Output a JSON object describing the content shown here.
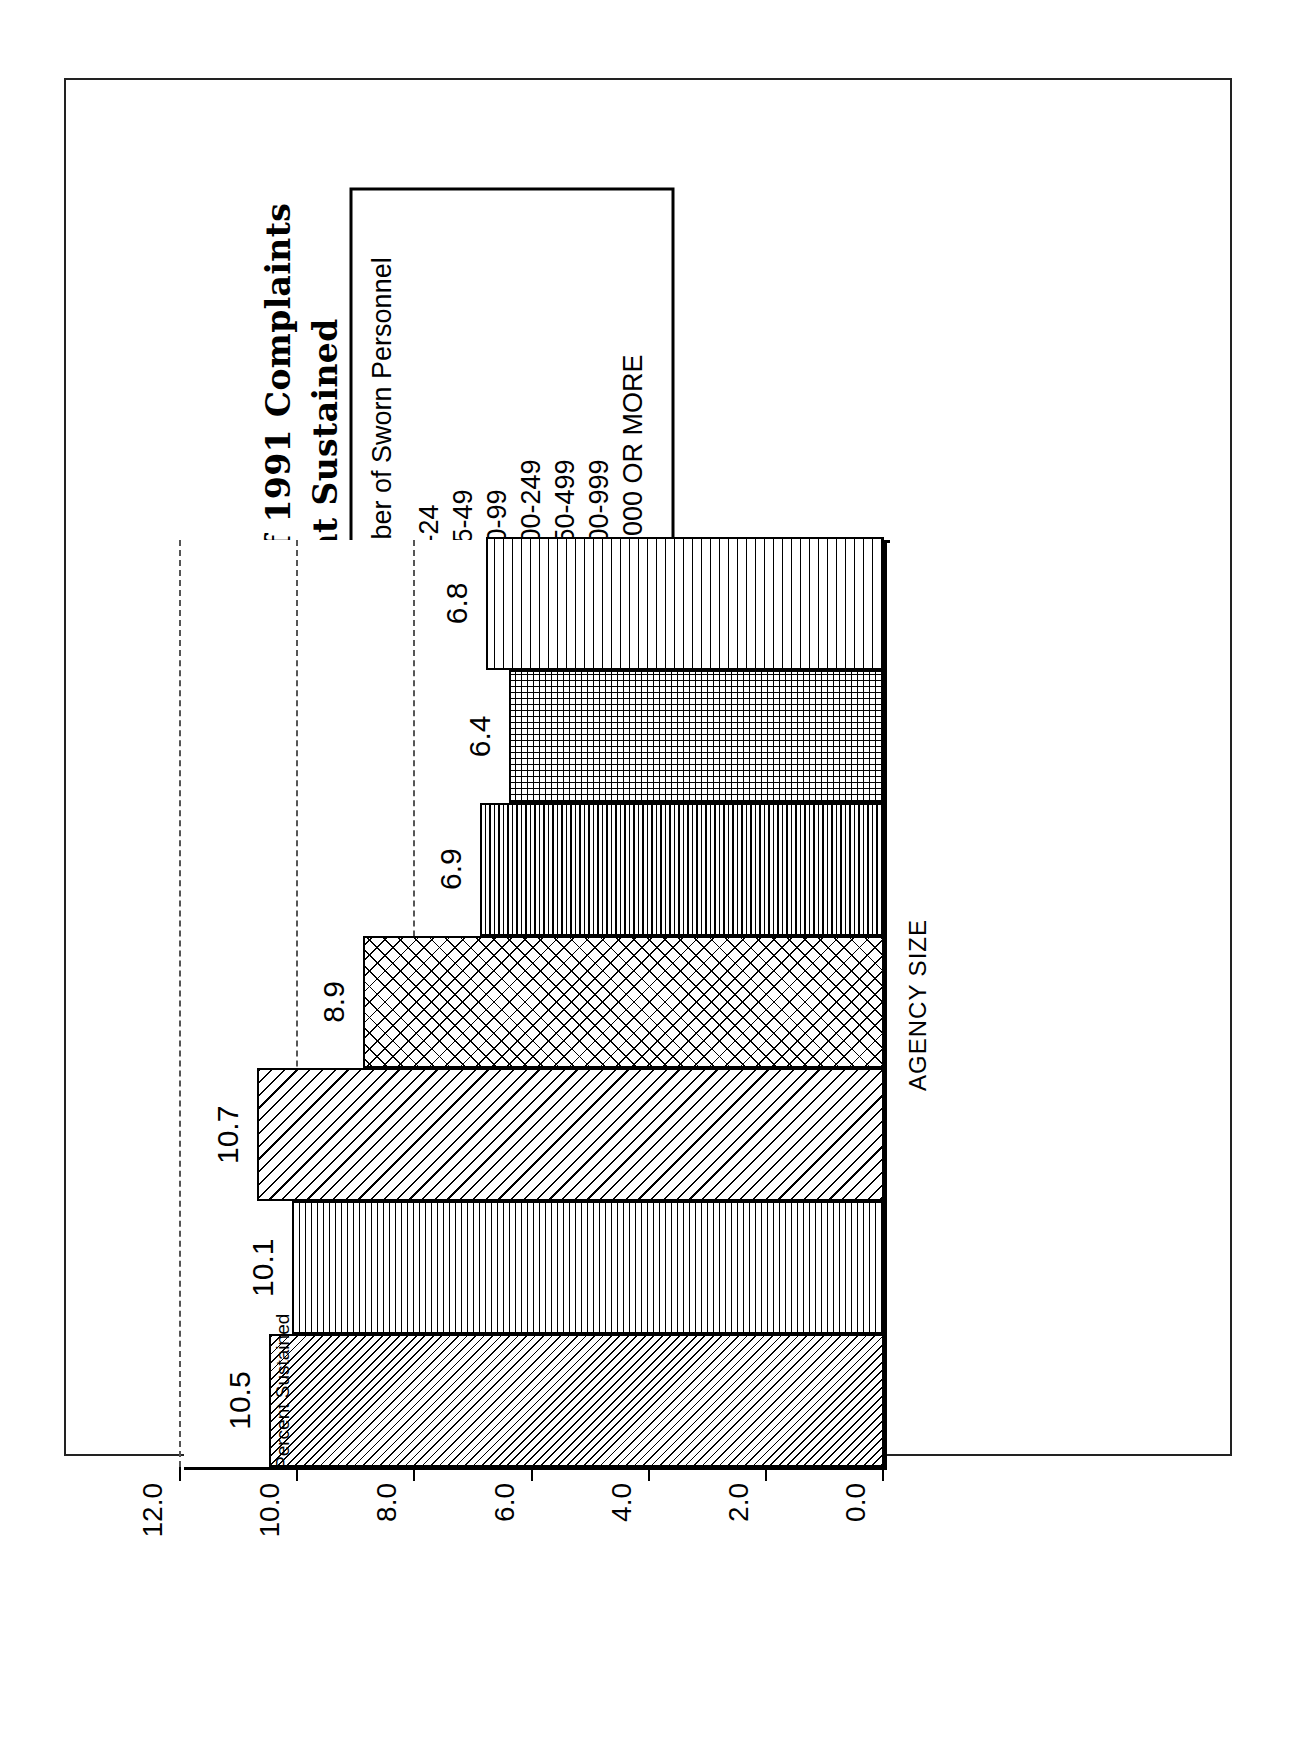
{
  "figure": {
    "title_lines": [
      "Figure 14.2: Final Disposition of 1991 Complaints",
      "of Excessive Force: Percent Sustained",
      "By City Agencies, By Size"
    ]
  },
  "legend": {
    "title": "Number of Sworn Personnel",
    "items": [
      {
        "label": "1-24",
        "pattern": "diagonal-thin"
      },
      {
        "label": "25-49",
        "pattern": "horizontal-lines"
      },
      {
        "label": "50-99",
        "pattern": "diagonal-medium"
      },
      {
        "label": "100-249",
        "pattern": "cross-hatch"
      },
      {
        "label": "250-499",
        "pattern": "horizontal-dense"
      },
      {
        "label": "500-999",
        "pattern": "grid-dense"
      },
      {
        "label": "1,000 OR MORE",
        "pattern": "horizontal-wide"
      }
    ]
  },
  "chart_data": {
    "type": "bar",
    "title": "Figure 14.2: Final Disposition of 1991 Complaints of Excessive Force: Percent Sustained By City Agencies, By Size",
    "xlabel": "AGENCY SIZE",
    "ylabel": "Percent Sustained",
    "categories": [
      "1-24",
      "25-49",
      "50-99",
      "100-249",
      "250-499",
      "500-999",
      "1,000 OR MORE"
    ],
    "values": [
      10.5,
      10.1,
      10.7,
      8.9,
      6.9,
      6.4,
      6.8
    ],
    "data_labels": [
      "10.5",
      "10.1",
      "10.7",
      "8.9",
      "6.9",
      "6.4",
      "6.8"
    ],
    "ylim": [
      0.0,
      12.0
    ],
    "yticks": [
      0.0,
      2.0,
      4.0,
      6.0,
      8.0,
      10.0,
      12.0
    ],
    "ytick_labels": [
      "0.0",
      "2.0",
      "4.0",
      "6.0",
      "8.0",
      "10.0",
      "12.0"
    ],
    "grid": "dashed horizontal gridlines at 2.0 intervals",
    "legend_position": "above plot",
    "orientation": "vertical bars (figure rotated 90 degrees on page)"
  },
  "axis": {
    "y_title": "Percent Sustained",
    "x_title": "AGENCY SIZE"
  }
}
